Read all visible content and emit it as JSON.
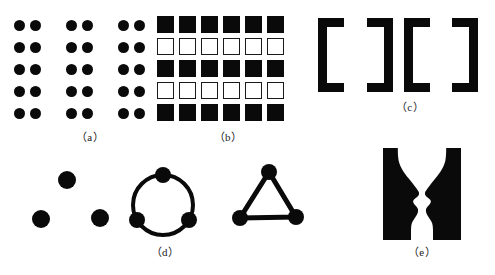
{
  "figure": {
    "background": "#ffffff",
    "ink": "#0a0a0a"
  },
  "captions": {
    "a": "（a）",
    "b": "（b）",
    "c": "（c）",
    "d": "（d）",
    "e": "（e）"
  },
  "panels": {
    "a": {
      "name": "proximity-dot-array",
      "rows": 5,
      "groups": 3,
      "dots_per_group": 2,
      "dot_color": "#0a0a0a",
      "dot_diameter": 11,
      "row_spacing": 22,
      "intra_group_gap": 16,
      "inter_group_gap": 36,
      "origin_x": 14,
      "origin_y": 20
    },
    "b": {
      "name": "similarity-square-grid",
      "columns": 6,
      "rows": 5,
      "row_fill_pattern": [
        "filled",
        "hollow",
        "filled",
        "hollow",
        "filled"
      ],
      "square_size": 17,
      "col_spacing": 22,
      "row_spacing": 22,
      "origin_x": 157,
      "origin_y": 16,
      "fill_color": "#0a0a0a",
      "stroke_color": "#1a1a1a"
    },
    "c": {
      "name": "closure-bracket-row",
      "brackets": [
        "left",
        "right",
        "left",
        "right"
      ],
      "bracket_color": "#0a0a0a",
      "bracket_height": 74,
      "bracket_width": 26,
      "stroke": 9,
      "origin_y": 18,
      "positions_x": [
        318,
        367,
        404,
        452
      ]
    },
    "d": {
      "name": "continuation-dot-shapes",
      "loose_dots": {
        "name": "ungrouped-dots",
        "count": 3,
        "points": [
          [
            67,
            180
          ],
          [
            41,
            219
          ],
          [
            100,
            218
          ]
        ],
        "radius": 9
      },
      "circle_figure": {
        "name": "dots-on-circle",
        "center": [
          163,
          205
        ],
        "radius": 30,
        "stroke": 4,
        "node_count": 3,
        "node_radius": 8,
        "node_angles_deg": [
          270,
          30,
          150
        ]
      },
      "triangle_figure": {
        "name": "dots-on-triangle",
        "vertices": [
          [
            269,
            172
          ],
          [
            240,
            218
          ],
          [
            296,
            217
          ]
        ],
        "stroke": 5,
        "node_radius": 8
      }
    },
    "e": {
      "name": "figure-ground-rubin-vase",
      "box": {
        "x": 383,
        "y": 148,
        "width": 78,
        "height": 92
      },
      "ink": "#0a0a0a",
      "ground": "#ffffff",
      "description": "two facing profiles / goblet reversible figure"
    }
  }
}
